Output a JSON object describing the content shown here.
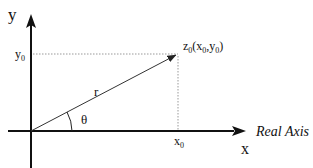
{
  "diagram": {
    "axes": {
      "y_label": "y",
      "x_label": "x",
      "x_axis_name": "Real Axis"
    },
    "point": {
      "label_main": "z",
      "label_sub": "0",
      "coords_open": "(x",
      "coords_sub1": "0",
      "coords_comma": ",y",
      "coords_sub2": "0",
      "coords_close": ")"
    },
    "projections": {
      "y0_main": "y",
      "y0_sub": "0",
      "x0_main": "x",
      "x0_sub": "0"
    },
    "vector_label": "r",
    "angle_label": "θ",
    "colors": {
      "axis": "#111111",
      "vector": "#333333",
      "dotted": "#999999"
    }
  }
}
